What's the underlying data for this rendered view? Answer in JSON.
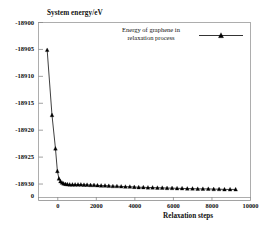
{
  "chart_data": {
    "type": "line",
    "title": "",
    "xlabel": "Relaxation steps",
    "ylabel": "System energy/eV",
    "xlim": [
      -1000,
      10000
    ],
    "ylim": [
      -18932.5,
      -18900
    ],
    "grid": false,
    "legend_position": "top-center",
    "series": [
      {
        "name": "Energy of graphene in relaxation process",
        "marker": "triangle-up",
        "color": "#000000",
        "x": [
          -550,
          -300,
          -120,
          -20,
          60,
          140,
          220,
          300,
          400,
          500,
          620,
          760,
          900,
          1050,
          1200,
          1360,
          1520,
          1700,
          1880,
          2060,
          2250,
          2450,
          2650,
          2860,
          3070,
          3290,
          3510,
          3740,
          3970,
          4200,
          4440,
          4680,
          4920,
          5170,
          5420,
          5670,
          5930,
          6190,
          6450,
          6720,
          6990,
          7260,
          7530,
          7810,
          8090,
          8370,
          8650,
          8940,
          9230
        ],
        "y": [
          -18905.1,
          -18917.2,
          -18923.4,
          -18927.6,
          -18929.0,
          -18929.5,
          -18929.75,
          -18929.9,
          -18930.0,
          -18930.05,
          -18930.1,
          -18930.1,
          -18930.1,
          -18930.1,
          -18930.1,
          -18930.15,
          -18930.15,
          -18930.2,
          -18930.2,
          -18930.25,
          -18930.3,
          -18930.3,
          -18930.35,
          -18930.4,
          -18930.4,
          -18930.45,
          -18930.5,
          -18930.5,
          -18930.55,
          -18930.6,
          -18930.6,
          -18930.65,
          -18930.65,
          -18930.7,
          -18930.7,
          -18930.75,
          -18930.75,
          -18930.8,
          -18930.8,
          -18930.85,
          -18930.85,
          -18930.9,
          -18930.9,
          -18930.9,
          -18930.95,
          -18930.95,
          -18931.0,
          -18931.0,
          -18931.0
        ]
      }
    ],
    "yticks": [
      {
        "value": -18900,
        "label": "-18900"
      },
      {
        "value": -18905,
        "label": "-18905"
      },
      {
        "value": -18910,
        "label": "-18910"
      },
      {
        "value": -18915,
        "label": "-18915"
      },
      {
        "value": -18920,
        "label": "-18920"
      },
      {
        "value": -18925,
        "label": "-18925"
      },
      {
        "value": -18930,
        "label": "-18930"
      }
    ],
    "yticks_extra": [
      {
        "label": "0"
      }
    ],
    "xticks": [
      {
        "value": 0,
        "label": "0"
      },
      {
        "value": 2000,
        "label": "2000"
      },
      {
        "value": 4000,
        "label": "4000"
      },
      {
        "value": 6000,
        "label": "6000"
      },
      {
        "value": 8000,
        "label": "8000"
      },
      {
        "value": 10000,
        "label": "10000"
      }
    ],
    "legend": [
      {
        "label": "Energy of graphene in\nrelaxation process",
        "marker": "triangle-up",
        "color": "#000000"
      }
    ]
  },
  "colors": {
    "axis": "#8a8a8a",
    "frame": "#9a9a9a",
    "data": "#111111",
    "text": "#111111"
  }
}
